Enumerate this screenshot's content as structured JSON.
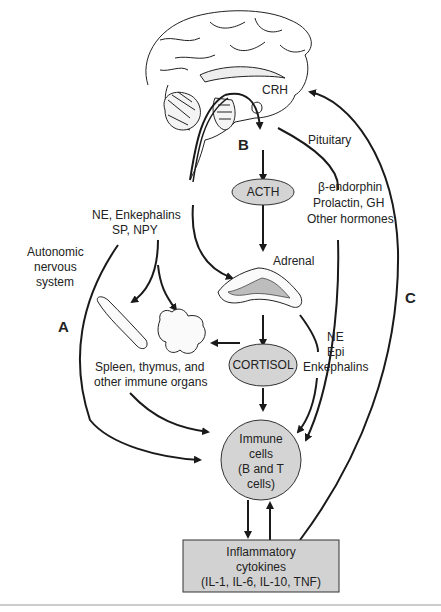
{
  "diagram": {
    "labels": {
      "crh": "CRH",
      "pituitary": "Pituitary",
      "b": "B",
      "a": "A",
      "c": "C",
      "acth": "ACTH",
      "adrenal": "Adrenal",
      "cortisol": "CORTISOL",
      "ans_line1": "Autonomic",
      "ans_line2": "nervous",
      "ans_line3": "system",
      "ne_enk_line1": "NE, Enkephalins",
      "ne_enk_line2": "SP, NPY",
      "pit_hormones_line1": "β-endorphin",
      "pit_hormones_line2": "Prolactin, GH",
      "pit_hormones_line3": "Other hormones",
      "adrenal_med_line1": "NE",
      "adrenal_med_line2": "Epi",
      "adrenal_med_line3": "Enkephalins",
      "organs_line1": "Spleen, thymus, and",
      "organs_line2": "other immune organs",
      "immune_line1": "Immune",
      "immune_line2": "cells",
      "immune_line3": "(B and T",
      "immune_line4": "cells)",
      "cytokines_line1": "Inflammatory",
      "cytokines_line2": "cytokines",
      "cytokines_line3": "(IL-1, IL-6, IL-10, TNF)"
    },
    "colors": {
      "node_fill": "#d4d4d4",
      "box_fill": "#d2d2d2",
      "stroke": "#1a1a1a",
      "adrenal_inner": "#bdbdbd"
    }
  }
}
